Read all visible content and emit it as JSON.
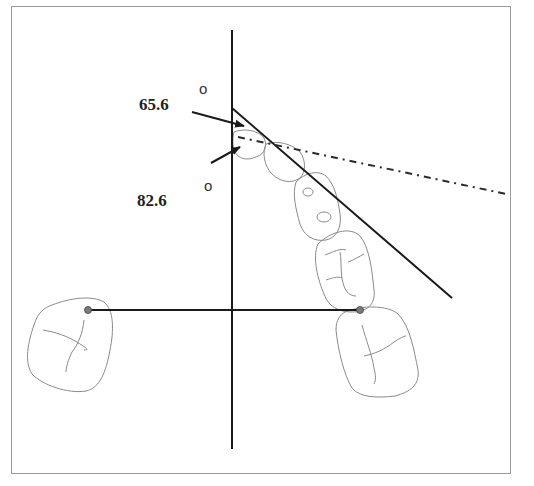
{
  "figure": {
    "type": "dental arch angle measurement diagram",
    "annotations": [
      {
        "id": "angle-upper",
        "value": "65.6",
        "unit_symbol": "o"
      },
      {
        "id": "angle-lower",
        "value": "82.6",
        "unit_symbol": "o"
      }
    ],
    "colors": {
      "line": "#1a1a1a",
      "tooth_outline": "#8a8a8a",
      "frame": "#9a9a9a",
      "landmark_dot": "#7a7a7a"
    }
  }
}
